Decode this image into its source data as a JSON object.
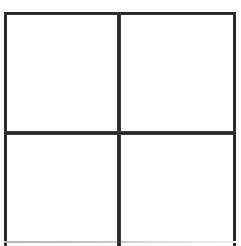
{
  "figure": {
    "background_color": "#ffffff",
    "line_color": "#1f1f1f",
    "faint_line_color": "#c2c2c2",
    "canvas": {
      "width": 241,
      "height": 246
    }
  },
  "grid": {
    "rows": 2,
    "columns": 2,
    "cell_count": 4,
    "frame": {
      "x": 4,
      "y": 12,
      "width": 232,
      "height": 234
    },
    "edges": [
      {
        "name": "top",
        "color": "#1c1c1c",
        "thickness": 3,
        "style": "solid"
      },
      {
        "name": "left",
        "color": "#1c1c1c",
        "thickness": 3,
        "style": "solid"
      },
      {
        "name": "right",
        "color": "#1c1c1c",
        "thickness": 3,
        "style": "solid"
      },
      {
        "name": "bottom",
        "color": "#c2c2c2",
        "thickness": 2,
        "style": "faint"
      }
    ],
    "dividers": [
      {
        "name": "vertical",
        "orientation": "vertical",
        "position": 119,
        "color": "#1a1a1a",
        "thickness": 4
      },
      {
        "name": "horizontal",
        "orientation": "horizontal",
        "position": 133,
        "color": "#1a1a1a",
        "thickness": 4
      }
    ],
    "intersection": {
      "x": 119,
      "y": 133
    },
    "cells": [
      {
        "id": "top-left",
        "label": "",
        "row": 1,
        "column": 1
      },
      {
        "id": "top-right",
        "label": "",
        "row": 1,
        "column": 2
      },
      {
        "id": "bottom-left",
        "label": "",
        "row": 2,
        "column": 1
      },
      {
        "id": "bottom-right",
        "label": "",
        "row": 2,
        "column": 2
      }
    ]
  }
}
